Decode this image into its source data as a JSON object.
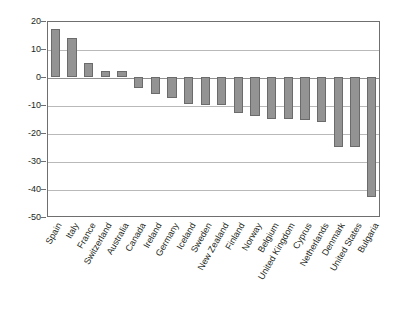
{
  "chart_data": {
    "type": "bar",
    "title": "",
    "xlabel": "",
    "ylabel": "",
    "ylim": [
      -50,
      20
    ],
    "ytick_step": 10,
    "yticks": [
      20,
      10,
      0,
      -10,
      -20,
      -30,
      -40,
      -50
    ],
    "ytick_labels": [
      "20",
      "10",
      "0",
      "-10",
      "-20",
      "-30",
      "-40",
      "-50"
    ],
    "grid": true,
    "legend": "none",
    "bar_color": "#939393",
    "bar_border_color": "#6b6b6b",
    "gridline_color": "#b9b9b9",
    "axis_color": "#6f6f6f",
    "categories": [
      "Spain",
      "Italy",
      "France",
      "Switzerland",
      "Australia",
      "Canada",
      "Ireland",
      "Germany",
      "Iceland",
      "Sweden",
      "New Zealand",
      "Finland",
      "Norway",
      "Belgium",
      "United Kingdom",
      "Cyprus",
      "Netherlands",
      "Denmark",
      "United States",
      "Bulgaria"
    ],
    "values": [
      17,
      14,
      5,
      2,
      2,
      -4,
      -6,
      -7.5,
      -9.5,
      -10,
      -10,
      -13,
      -14,
      -15,
      -15,
      -15.5,
      -16,
      -25,
      -25,
      -43
    ]
  }
}
